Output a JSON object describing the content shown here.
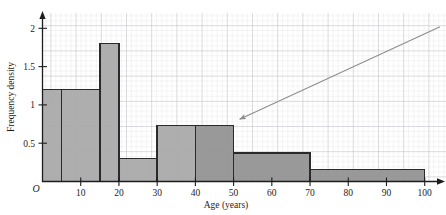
{
  "figure": {
    "background_color": "#ffffff",
    "grid_minor_color": "#d8d8dc",
    "grid_major_color": "#b9b9c2",
    "axis_color": "#1d1d1d",
    "bar_edge_color": "#2a2a2a",
    "bar_fill_light": "#aaaaaa",
    "bar_fill_dark": "#949494",
    "annotation_color": "#8d8d8d"
  },
  "chart_data": {
    "type": "bar",
    "title": "",
    "xlabel": "Age (years)",
    "ylabel": "Frequency density",
    "xlim": [
      0,
      104
    ],
    "ylim": [
      0,
      2.2
    ],
    "grid": true,
    "legend": "none",
    "origin_label": "O",
    "x_ticks": [
      10,
      20,
      30,
      40,
      50,
      60,
      70,
      80,
      90,
      100
    ],
    "x_tick_labels": [
      "10",
      "20",
      "30",
      "40",
      "50",
      "60",
      "70",
      "80",
      "90",
      "100"
    ],
    "y_ticks": [
      0.5,
      1,
      1.5,
      2
    ],
    "y_tick_labels": [
      "0.5",
      "1",
      "1.5",
      "2"
    ],
    "bins": [
      {
        "label": "0-5",
        "x0": 0,
        "x1": 5,
        "density": 1.2,
        "shade": "light"
      },
      {
        "label": "5-15",
        "x0": 5,
        "x1": 15,
        "density": 1.2,
        "shade": "light"
      },
      {
        "label": "15-20",
        "x0": 15,
        "x1": 20,
        "density": 1.8,
        "shade": "light"
      },
      {
        "label": "20-30",
        "x0": 20,
        "x1": 30,
        "density": 0.3,
        "shade": "light"
      },
      {
        "label": "30-40",
        "x0": 30,
        "x1": 40,
        "density": 0.73,
        "shade": "light"
      },
      {
        "label": "40-50",
        "x0": 40,
        "x1": 50,
        "density": 0.73,
        "shade": "dark"
      },
      {
        "label": "50-70",
        "x0": 50,
        "x1": 70,
        "density": 0.37,
        "shade": "dark"
      },
      {
        "label": "70-100",
        "x0": 70,
        "x1": 100,
        "density": 0.16,
        "shade": "dark"
      }
    ],
    "annotations": [
      {
        "name": "pointer-arrow",
        "type": "arrow",
        "from_x": 104.0,
        "from_y": 2.02,
        "to_x": 50.0,
        "to_y": 0.76,
        "text": ""
      }
    ]
  }
}
